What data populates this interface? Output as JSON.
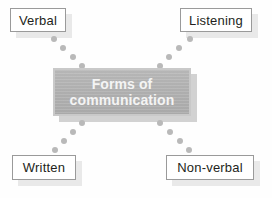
{
  "diagram": {
    "type": "mind-map",
    "title": "Forms of communication",
    "center": {
      "name": "hub",
      "line1": "Forms of",
      "line2": "communication",
      "text_color": "#f4f4f4",
      "fill_color": "#aeaeae",
      "border_color": "#c9c9c9"
    },
    "nodes": [
      {
        "id": "verbal",
        "label": "Verbal",
        "position": "top-left"
      },
      {
        "id": "listening",
        "label": "Listening",
        "position": "top-right"
      },
      {
        "id": "written",
        "label": "Written",
        "position": "bottom-left"
      },
      {
        "id": "nonverbal",
        "label": "Non-verbal",
        "position": "bottom-right"
      }
    ],
    "connectors": [
      {
        "from": "verbal",
        "to": "hub",
        "style": "dotted",
        "dot_color": "#b9b9b9",
        "dot_count": 4
      },
      {
        "from": "listening",
        "to": "hub",
        "style": "dotted",
        "dot_color": "#b9b9b9",
        "dot_count": 4
      },
      {
        "from": "hub",
        "to": "written",
        "style": "dotted",
        "dot_color": "#b9b9b9",
        "dot_count": 4
      },
      {
        "from": "hub",
        "to": "nonverbal",
        "style": "dotted",
        "dot_color": "#b9b9b9",
        "dot_count": 4
      }
    ],
    "node_style": {
      "background": "#ffffff",
      "border_color": "#9a9a9a",
      "text_color": "#231f20",
      "shadow_color": "#e9e9e9"
    },
    "background_color": "#fefefe"
  }
}
